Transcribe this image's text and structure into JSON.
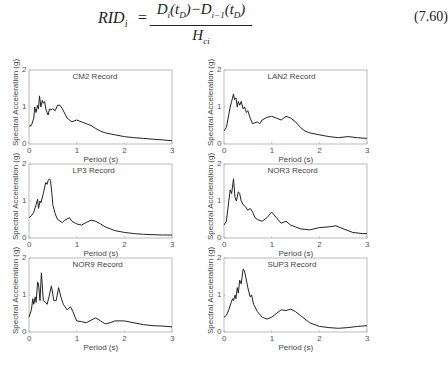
{
  "equation": {
    "lhs": "RID",
    "lhs_sub": "i",
    "equals": "=",
    "numerator": "D_i(t_D)−D_{i−1}(t_D)",
    "denominator": "H_ci",
    "number": "(7.60)"
  },
  "chart_data": [
    {
      "type": "line",
      "title": "CM2 Record",
      "xlabel": "Period (s)",
      "ylabel": "Spectral Acceleration (g)",
      "xlim": [
        0,
        3
      ],
      "ylim": [
        0,
        2
      ],
      "xticks": [
        "0",
        "1",
        "2",
        "3"
      ],
      "yticks": [
        "0",
        "1",
        "2"
      ],
      "grid": false,
      "x": [
        0,
        0.05,
        0.1,
        0.12,
        0.15,
        0.18,
        0.2,
        0.22,
        0.25,
        0.28,
        0.3,
        0.33,
        0.35,
        0.38,
        0.4,
        0.43,
        0.45,
        0.5,
        0.55,
        0.6,
        0.65,
        0.7,
        0.8,
        0.9,
        1.0,
        1.1,
        1.2,
        1.3,
        1.4,
        1.5,
        1.6,
        1.8,
        2.0,
        2.2,
        2.4,
        2.6,
        2.8,
        3.0
      ],
      "y": [
        0.48,
        0.5,
        0.7,
        1.0,
        0.85,
        1.05,
        0.95,
        1.3,
        1.0,
        1.18,
        1.1,
        1.15,
        0.95,
        0.85,
        0.78,
        0.95,
        0.92,
        0.95,
        0.9,
        1.05,
        1.05,
        0.95,
        0.7,
        0.6,
        0.65,
        0.6,
        0.55,
        0.5,
        0.42,
        0.35,
        0.3,
        0.25,
        0.2,
        0.17,
        0.15,
        0.13,
        0.11,
        0.09
      ]
    },
    {
      "type": "line",
      "title": "LAN2 Record",
      "xlabel": "Period (s)",
      "ylabel": "Spectral Acceleration (g)",
      "xlim": [
        0,
        3
      ],
      "ylim": [
        0,
        2
      ],
      "xticks": [
        "0",
        "1",
        "2",
        "3"
      ],
      "yticks": [
        "0",
        "1",
        "2"
      ],
      "grid": false,
      "x": [
        0,
        0.05,
        0.1,
        0.13,
        0.16,
        0.2,
        0.22,
        0.25,
        0.28,
        0.3,
        0.33,
        0.36,
        0.4,
        0.43,
        0.47,
        0.5,
        0.55,
        0.6,
        0.7,
        0.75,
        0.8,
        0.9,
        1.0,
        1.1,
        1.2,
        1.3,
        1.4,
        1.5,
        1.6,
        1.7,
        1.8,
        2.0,
        2.2,
        2.4,
        2.6,
        2.8,
        3.0
      ],
      "y": [
        0.35,
        0.45,
        0.8,
        1.0,
        1.15,
        1.35,
        1.2,
        1.25,
        1.0,
        1.15,
        1.05,
        1.15,
        0.95,
        1.0,
        0.85,
        0.9,
        0.7,
        0.55,
        0.6,
        0.55,
        0.65,
        0.72,
        0.75,
        0.7,
        0.65,
        0.75,
        0.7,
        0.6,
        0.45,
        0.35,
        0.3,
        0.25,
        0.2,
        0.17,
        0.2,
        0.17,
        0.15
      ]
    },
    {
      "type": "line",
      "title": "LP3 Record",
      "xlabel": "Period (s)",
      "ylabel": "Spectral Acceleration (g)",
      "xlim": [
        0,
        3
      ],
      "ylim": [
        0,
        2
      ],
      "xticks": [
        "0",
        "1",
        "2",
        "3"
      ],
      "yticks": [
        "0",
        "1",
        "2"
      ],
      "grid": false,
      "x": [
        0,
        0.05,
        0.1,
        0.15,
        0.18,
        0.2,
        0.23,
        0.25,
        0.3,
        0.35,
        0.38,
        0.4,
        0.43,
        0.45,
        0.48,
        0.5,
        0.55,
        0.6,
        0.7,
        0.75,
        0.85,
        0.9,
        1.0,
        1.1,
        1.2,
        1.3,
        1.4,
        1.5,
        1.6,
        1.8,
        2.0,
        2.2,
        2.4,
        2.6,
        2.8,
        3.0
      ],
      "y": [
        0.55,
        0.6,
        0.7,
        0.9,
        1.05,
        0.8,
        1.0,
        0.95,
        1.2,
        1.5,
        1.45,
        1.55,
        1.6,
        1.55,
        1.2,
        0.9,
        0.65,
        0.5,
        0.42,
        0.48,
        0.55,
        0.45,
        0.38,
        0.35,
        0.42,
        0.48,
        0.45,
        0.38,
        0.3,
        0.2,
        0.15,
        0.12,
        0.1,
        0.09,
        0.08,
        0.08
      ]
    },
    {
      "type": "line",
      "title": "NOR3 Record",
      "xlabel": "Period (s)",
      "ylabel": "Spectral Acceleration (g)",
      "xlim": [
        0,
        3
      ],
      "ylim": [
        0,
        2
      ],
      "xticks": [
        "0",
        "1",
        "2",
        "3"
      ],
      "yticks": [
        "0",
        "1",
        "2"
      ],
      "grid": false,
      "x": [
        0,
        0.05,
        0.1,
        0.13,
        0.16,
        0.2,
        0.23,
        0.26,
        0.3,
        0.33,
        0.36,
        0.4,
        0.45,
        0.5,
        0.55,
        0.6,
        0.65,
        0.7,
        0.8,
        0.9,
        1.0,
        1.1,
        1.2,
        1.3,
        1.4,
        1.5,
        1.6,
        1.8,
        2.0,
        2.2,
        2.35,
        2.5,
        2.7,
        2.9,
        3.0
      ],
      "y": [
        0.35,
        0.45,
        1.0,
        1.3,
        1.2,
        1.6,
        1.1,
        1.0,
        1.25,
        1.2,
        1.0,
        0.9,
        0.85,
        0.75,
        0.8,
        0.7,
        0.55,
        0.5,
        0.45,
        0.55,
        0.7,
        0.55,
        0.4,
        0.45,
        0.35,
        0.3,
        0.25,
        0.22,
        0.28,
        0.3,
        0.33,
        0.25,
        0.15,
        0.12,
        0.12
      ]
    },
    {
      "type": "line",
      "title": "NOR9 Record",
      "xlabel": "Period (s)",
      "ylabel": "Spectral Acceleration (g)",
      "xlim": [
        0,
        3
      ],
      "ylim": [
        0,
        2
      ],
      "xticks": [
        "0",
        "1",
        "2",
        "3"
      ],
      "yticks": [
        "0",
        "1",
        "2"
      ],
      "grid": false,
      "x": [
        0,
        0.05,
        0.08,
        0.1,
        0.13,
        0.15,
        0.18,
        0.2,
        0.23,
        0.26,
        0.3,
        0.35,
        0.38,
        0.42,
        0.47,
        0.52,
        0.57,
        0.62,
        0.67,
        0.72,
        0.8,
        0.87,
        0.92,
        1.0,
        1.1,
        1.2,
        1.3,
        1.4,
        1.5,
        1.6,
        1.7,
        1.8,
        2.0,
        2.2,
        2.4,
        2.6,
        2.8,
        3.0
      ],
      "y": [
        0.4,
        0.6,
        0.9,
        0.75,
        0.95,
        0.8,
        1.35,
        1.3,
        0.85,
        1.6,
        0.85,
        0.8,
        0.75,
        0.95,
        1.25,
        0.85,
        0.85,
        1.2,
        0.95,
        0.75,
        0.6,
        0.68,
        0.55,
        0.3,
        0.28,
        0.25,
        0.32,
        0.38,
        0.3,
        0.22,
        0.25,
        0.3,
        0.3,
        0.25,
        0.2,
        0.17,
        0.16,
        0.14
      ]
    },
    {
      "type": "line",
      "title": "SUP3 Record",
      "xlabel": "Period (s)",
      "ylabel": "Spectral Acceleration (g)",
      "xlim": [
        0,
        3
      ],
      "ylim": [
        0,
        2
      ],
      "xticks": [
        "0",
        "1",
        "2",
        "3"
      ],
      "yticks": [
        "0",
        "1",
        "2"
      ],
      "grid": false,
      "x": [
        0,
        0.05,
        0.1,
        0.15,
        0.18,
        0.2,
        0.23,
        0.25,
        0.28,
        0.3,
        0.33,
        0.36,
        0.4,
        0.43,
        0.47,
        0.5,
        0.55,
        0.58,
        0.62,
        0.7,
        0.8,
        0.9,
        1.0,
        1.1,
        1.2,
        1.3,
        1.4,
        1.5,
        1.6,
        1.8,
        2.0,
        2.2,
        2.4,
        2.6,
        2.8,
        3.0
      ],
      "y": [
        0.4,
        0.45,
        0.6,
        0.8,
        0.9,
        0.85,
        1.0,
        0.9,
        1.2,
        1.05,
        1.4,
        1.3,
        1.7,
        1.65,
        1.4,
        1.2,
        0.95,
        1.0,
        0.75,
        0.55,
        0.4,
        0.35,
        0.4,
        0.5,
        0.6,
        0.58,
        0.62,
        0.55,
        0.45,
        0.25,
        0.15,
        0.12,
        0.1,
        0.12,
        0.15,
        0.17
      ]
    }
  ]
}
